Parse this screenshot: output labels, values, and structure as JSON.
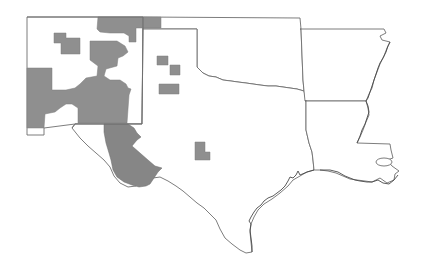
{
  "map": {
    "type": "regional outline map",
    "states": [
      "New Mexico",
      "Texas",
      "Oklahoma",
      "Arkansas",
      "Louisiana"
    ],
    "colors": {
      "background": "#ffffff",
      "border": "#6e6e6e",
      "coastline": "#4a4a4a",
      "shaded_region": "#8f8f8f"
    },
    "shaded_regions": [
      {
        "id": "nm-northeast",
        "state": "New Mexico"
      },
      {
        "id": "nm-northwest-small",
        "state": "New Mexico"
      },
      {
        "id": "nm-central",
        "state": "New Mexico"
      },
      {
        "id": "nm-west",
        "state": "New Mexico"
      },
      {
        "id": "ok-panhandle-west",
        "state": "Oklahoma"
      },
      {
        "id": "tx-panhandle-1",
        "state": "Texas"
      },
      {
        "id": "tx-panhandle-2",
        "state": "Texas"
      },
      {
        "id": "tx-panhandle-3",
        "state": "Texas"
      },
      {
        "id": "tx-trans-pecos",
        "state": "Texas"
      },
      {
        "id": "tx-central-west",
        "state": "Texas"
      }
    ]
  }
}
